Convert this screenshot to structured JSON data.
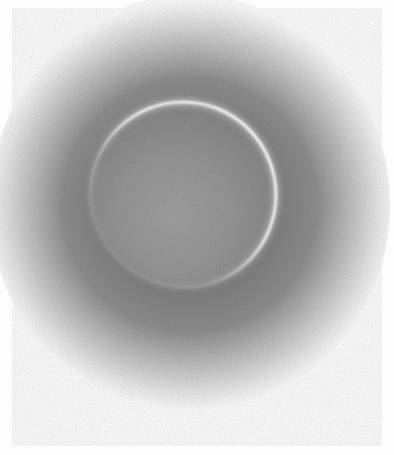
{
  "image": {
    "subject": "Drawing of a solar eclipse: dark lunar disk with a thin bright crescent rim, surrounded by a dark grainy halo fading to white",
    "style": "grayscale graphite/charcoal sketch",
    "colors": {
      "background": "#fbfbfb",
      "halo_dark": "#7a7a7a",
      "disk": "#8c8c8c",
      "disk_light": "#a3a3a3",
      "rim": "#f2f2f2"
    }
  }
}
